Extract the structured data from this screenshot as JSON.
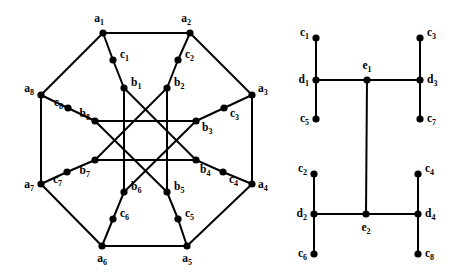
{
  "figure": {
    "name": "two-graph-diagram",
    "background": "#ffffff",
    "stroke_color": "#000000",
    "node_fill": "#000000",
    "node_radius": 3.6,
    "edge_width": 2.0
  },
  "graphs": [
    {
      "id": "left-graph",
      "name": "octagonal-star-graph",
      "nodes": [
        {
          "id": "a1",
          "base": "a",
          "sub": "1",
          "x": 103,
          "y": 33,
          "lx": 99,
          "ly": 22,
          "anchor": "middle"
        },
        {
          "id": "a2",
          "base": "a",
          "sub": "2",
          "x": 190,
          "y": 33,
          "lx": 186,
          "ly": 22,
          "anchor": "middle"
        },
        {
          "id": "a3",
          "base": "a",
          "sub": "3",
          "x": 252,
          "y": 95,
          "lx": 258,
          "ly": 92,
          "anchor": "start"
        },
        {
          "id": "a4",
          "base": "a",
          "sub": "4",
          "x": 252,
          "y": 184,
          "lx": 258,
          "ly": 188,
          "anchor": "start"
        },
        {
          "id": "a5",
          "base": "a",
          "sub": "5",
          "x": 187,
          "y": 246,
          "lx": 187,
          "ly": 262,
          "anchor": "middle"
        },
        {
          "id": "a6",
          "base": "a",
          "sub": "6",
          "x": 102,
          "y": 246,
          "lx": 102,
          "ly": 262,
          "anchor": "middle"
        },
        {
          "id": "a7",
          "base": "a",
          "sub": "7",
          "x": 41,
          "y": 184,
          "lx": 34,
          "ly": 188,
          "anchor": "end"
        },
        {
          "id": "a8",
          "base": "a",
          "sub": "8",
          "x": 41,
          "y": 95,
          "lx": 34,
          "ly": 92,
          "anchor": "end"
        },
        {
          "id": "c1",
          "base": "c",
          "sub": "1",
          "x": 113,
          "y": 60,
          "lx": 120,
          "ly": 58,
          "anchor": "start"
        },
        {
          "id": "c2",
          "base": "c",
          "sub": "2",
          "x": 178,
          "y": 60,
          "lx": 185,
          "ly": 58,
          "anchor": "start"
        },
        {
          "id": "c3",
          "base": "c",
          "sub": "3",
          "x": 224,
          "y": 108,
          "lx": 230,
          "ly": 117,
          "anchor": "start"
        },
        {
          "id": "c4",
          "base": "c",
          "sub": "4",
          "x": 223,
          "y": 172,
          "lx": 229,
          "ly": 183,
          "anchor": "start"
        },
        {
          "id": "c5",
          "base": "c",
          "sub": "5",
          "x": 178,
          "y": 219,
          "lx": 185,
          "ly": 217,
          "anchor": "start"
        },
        {
          "id": "c6",
          "base": "c",
          "sub": "6",
          "x": 113,
          "y": 219,
          "lx": 120,
          "ly": 217,
          "anchor": "start"
        },
        {
          "id": "c7",
          "base": "c",
          "sub": "7",
          "x": 67,
          "y": 172,
          "lx": 62,
          "ly": 183,
          "anchor": "end"
        },
        {
          "id": "c8",
          "base": "c",
          "sub": "8",
          "x": 68,
          "y": 108,
          "lx": 63,
          "ly": 106,
          "anchor": "end"
        },
        {
          "id": "b1",
          "base": "b",
          "sub": "1",
          "x": 124,
          "y": 88,
          "lx": 131,
          "ly": 86,
          "anchor": "start"
        },
        {
          "id": "b2",
          "base": "b",
          "sub": "2",
          "x": 167,
          "y": 88,
          "lx": 174,
          "ly": 86,
          "anchor": "start"
        },
        {
          "id": "b3",
          "base": "b",
          "sub": "3",
          "x": 196,
          "y": 121,
          "lx": 202,
          "ly": 131,
          "anchor": "start"
        },
        {
          "id": "b4",
          "base": "b",
          "sub": "4",
          "x": 196,
          "y": 160,
          "lx": 200,
          "ly": 173,
          "anchor": "start"
        },
        {
          "id": "b5",
          "base": "b",
          "sub": "5",
          "x": 167,
          "y": 192,
          "lx": 174,
          "ly": 190,
          "anchor": "start"
        },
        {
          "id": "b6",
          "base": "b",
          "sub": "6",
          "x": 124,
          "y": 192,
          "lx": 131,
          "ly": 190,
          "anchor": "start"
        },
        {
          "id": "b7",
          "base": "b",
          "sub": "7",
          "x": 95,
          "y": 160,
          "lx": 90,
          "ly": 174,
          "anchor": "end"
        },
        {
          "id": "b8",
          "base": "b",
          "sub": "8",
          "x": 95,
          "y": 121,
          "lx": 90,
          "ly": 117,
          "anchor": "end"
        }
      ],
      "edges": [
        [
          "a1",
          "a2"
        ],
        [
          "a2",
          "a3"
        ],
        [
          "a3",
          "a4"
        ],
        [
          "a4",
          "a5"
        ],
        [
          "a5",
          "a6"
        ],
        [
          "a6",
          "a7"
        ],
        [
          "a7",
          "a8"
        ],
        [
          "a8",
          "a1"
        ],
        [
          "a1",
          "c1"
        ],
        [
          "c1",
          "b1"
        ],
        [
          "a2",
          "c2"
        ],
        [
          "c2",
          "b2"
        ],
        [
          "a3",
          "c3"
        ],
        [
          "c3",
          "b3"
        ],
        [
          "a4",
          "c4"
        ],
        [
          "c4",
          "b4"
        ],
        [
          "a5",
          "c5"
        ],
        [
          "c5",
          "b5"
        ],
        [
          "a6",
          "c6"
        ],
        [
          "c6",
          "b6"
        ],
        [
          "a7",
          "c7"
        ],
        [
          "c7",
          "b7"
        ],
        [
          "a8",
          "c8"
        ],
        [
          "c8",
          "b8"
        ],
        [
          "b1",
          "b6"
        ],
        [
          "b2",
          "b5"
        ],
        [
          "b8",
          "b3"
        ],
        [
          "b7",
          "b4"
        ],
        [
          "b1",
          "b4"
        ],
        [
          "b2",
          "b7"
        ],
        [
          "b3",
          "b6"
        ],
        [
          "b5",
          "b8"
        ]
      ]
    },
    {
      "id": "right-graph",
      "name": "tree-graph",
      "nodes": [
        {
          "id": "c1",
          "base": "c",
          "sub": "1",
          "x": 316,
          "y": 38,
          "lx": 309,
          "ly": 36,
          "anchor": "end"
        },
        {
          "id": "d1",
          "base": "d",
          "sub": "1",
          "x": 316,
          "y": 80,
          "lx": 309,
          "ly": 83,
          "anchor": "end"
        },
        {
          "id": "c5",
          "base": "c",
          "sub": "5",
          "x": 316,
          "y": 119,
          "lx": 309,
          "ly": 122,
          "anchor": "end"
        },
        {
          "id": "e1",
          "base": "e",
          "sub": "1",
          "x": 367,
          "y": 80,
          "lx": 367,
          "ly": 69,
          "anchor": "middle"
        },
        {
          "id": "c3",
          "base": "c",
          "sub": "3",
          "x": 420,
          "y": 38,
          "lx": 427,
          "ly": 36,
          "anchor": "start"
        },
        {
          "id": "d3",
          "base": "d",
          "sub": "3",
          "x": 420,
          "y": 80,
          "lx": 427,
          "ly": 83,
          "anchor": "start"
        },
        {
          "id": "c7",
          "base": "c",
          "sub": "7",
          "x": 420,
          "y": 119,
          "lx": 427,
          "ly": 122,
          "anchor": "start"
        },
        {
          "id": "c2",
          "base": "c",
          "sub": "2",
          "x": 314,
          "y": 174,
          "lx": 307,
          "ly": 172,
          "anchor": "end"
        },
        {
          "id": "d2",
          "base": "d",
          "sub": "2",
          "x": 314,
          "y": 214,
          "lx": 307,
          "ly": 217,
          "anchor": "end"
        },
        {
          "id": "c6",
          "base": "c",
          "sub": "6",
          "x": 314,
          "y": 254,
          "lx": 307,
          "ly": 257,
          "anchor": "end"
        },
        {
          "id": "e2",
          "base": "e",
          "sub": "2",
          "x": 366,
          "y": 214,
          "lx": 366,
          "ly": 231,
          "anchor": "middle"
        },
        {
          "id": "c4",
          "base": "c",
          "sub": "4",
          "x": 418,
          "y": 174,
          "lx": 425,
          "ly": 172,
          "anchor": "start"
        },
        {
          "id": "d4",
          "base": "d",
          "sub": "4",
          "x": 418,
          "y": 214,
          "lx": 425,
          "ly": 217,
          "anchor": "start"
        },
        {
          "id": "c8",
          "base": "c",
          "sub": "8",
          "x": 418,
          "y": 254,
          "lx": 425,
          "ly": 257,
          "anchor": "start"
        }
      ],
      "edges": [
        [
          "c1",
          "d1"
        ],
        [
          "d1",
          "c5"
        ],
        [
          "d1",
          "e1"
        ],
        [
          "e1",
          "d3"
        ],
        [
          "c3",
          "d3"
        ],
        [
          "d3",
          "c7"
        ],
        [
          "e1",
          "e2"
        ],
        [
          "c2",
          "d2"
        ],
        [
          "d2",
          "c6"
        ],
        [
          "d2",
          "e2"
        ],
        [
          "e2",
          "d4"
        ],
        [
          "c4",
          "d4"
        ],
        [
          "d4",
          "c8"
        ]
      ]
    }
  ]
}
